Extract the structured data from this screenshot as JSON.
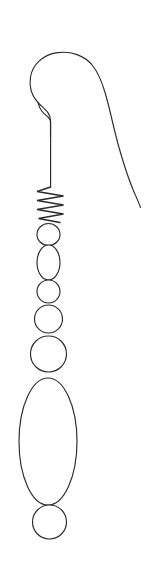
{
  "image": {
    "title": "Earring Line Drawing",
    "subject": "french-hook-beaded-earring",
    "alt_text": "Black line drawing of a french hook earring with a coiled spring and a vertical chain of graduated round and oval beads",
    "width": 159,
    "height": 576,
    "background_color": "#ffffff",
    "stroke_color": "#2b2b2b",
    "stroke_width": 1.15,
    "style": "monochrome-outline-sketch",
    "fill": "none"
  },
  "parts": [
    {
      "name": "ear-wire-hook",
      "label": "Ear wire hook",
      "description": "Long curved french hook wire arching over from the left, curving down the right side to a free tapered end",
      "path": "M 50.5 137 L 50.5 121 C 50.5 112 44.0 109.0 38.0 102.5 C 31.5 95.5 29.0 86.0 30.5 77.0 C 32.5 64.5 43.0 54.5 57.5 52.6 C 71.0 50.8 84.5 55.6 92.5 65.5 C 99.0 73.6 102.5 83.5 105.5 94.0 C 110.5 111.5 114.0 130.0 119.0 147.5 C 123.0 161.5 127.5 176.5 133.0 189.5 C 136.0 196.5 138.5 202.0 140.5 207.5"
    },
    {
      "name": "hook-left-shoulder",
      "label": "Hook inner shoulder bend",
      "description": "Short bend connecting the hook's descending left arc into the straight drop wire",
      "path": "M 38.2 102.8 C 39.5 110.5 44.5 114.0 49.0 118.0 C 50.2 119.2 50.5 120.3 50.5 122.0"
    },
    {
      "name": "drop-wire",
      "label": "Straight drop wire",
      "description": "Vertical straight wire segment between the hook and the coil",
      "path": "M 50.6 121.5 L 50.6 187.0"
    },
    {
      "name": "coil-spring",
      "label": "Coiled spring wrap",
      "description": "Zigzag coil wrapping representing a wound wire spring",
      "zigzag": {
        "top_y": 187,
        "bottom_y": 221,
        "left_x": 36,
        "right_x": 64,
        "turns": 7
      },
      "path": "M 50.6 187.0 L 37.0 191.5 L 63.5 196.0 L 37.0 200.5 L 63.5 205.0 L 37.0 209.5 L 63.5 214.0 L 38.5 218.5 L 60.0 222.5"
    }
  ],
  "beads": [
    {
      "name": "bead-1-circle-small",
      "label": "Small round bead",
      "shape": "circle",
      "cx": 48.5,
      "cy": 234.5,
      "rx": 11.5,
      "ry": 11.0,
      "order": 1
    },
    {
      "name": "bead-2-oval",
      "label": "Oval bead",
      "shape": "ellipse",
      "cx": 48.5,
      "cy": 262.5,
      "rx": 11.5,
      "ry": 17.5,
      "order": 2
    },
    {
      "name": "bead-3-circle",
      "label": "Round bead",
      "shape": "circle",
      "cx": 48.5,
      "cy": 291.5,
      "rx": 11.5,
      "ry": 11.5,
      "order": 3
    },
    {
      "name": "bead-4-circle",
      "label": "Round bead",
      "shape": "circle",
      "cx": 48.5,
      "cy": 319.0,
      "rx": 14.0,
      "ry": 14.0,
      "order": 4
    },
    {
      "name": "bead-5-circle-large",
      "label": "Large round bead",
      "shape": "circle",
      "cx": 48.5,
      "cy": 354.0,
      "rx": 18.0,
      "ry": 18.0,
      "order": 5
    },
    {
      "name": "bead-6-ellipse-large",
      "label": "Large oval drop bead",
      "shape": "ellipse",
      "cx": 48.0,
      "cy": 441.5,
      "rx": 29.0,
      "ry": 63.5,
      "order": 6
    },
    {
      "name": "bead-7-circle-bottom",
      "label": "Bottom round bead",
      "shape": "circle",
      "cx": 49.5,
      "cy": 522.0,
      "rx": 17.0,
      "ry": 17.0,
      "order": 7
    }
  ]
}
